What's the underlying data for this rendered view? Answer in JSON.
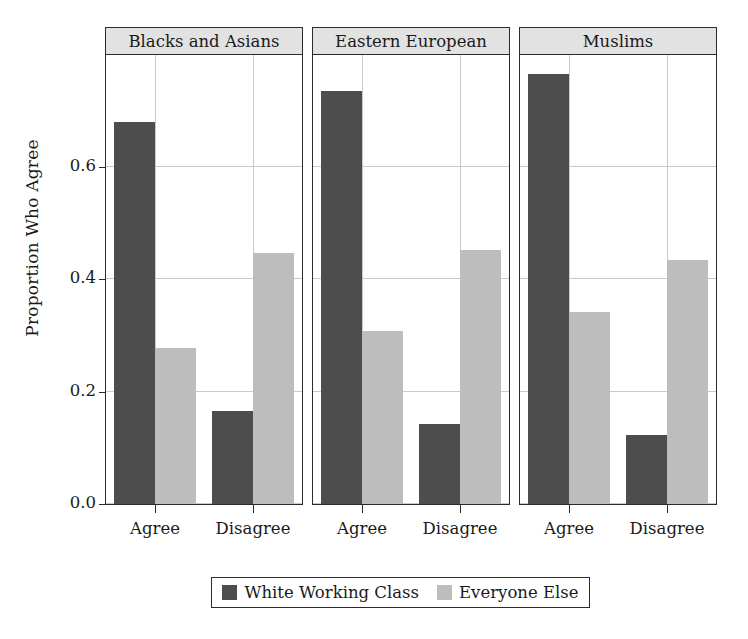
{
  "chart_data": {
    "type": "bar",
    "title": "",
    "subtitle": "",
    "xlabel": "",
    "ylabel": "Proportion Who Agree",
    "ylim": [
      0,
      0.8
    ],
    "yticks": [
      0.0,
      0.2,
      0.4,
      0.6
    ],
    "ytick_labels": [
      "0.0",
      "0.2",
      "0.4",
      "0.6"
    ],
    "grid": true,
    "legend_position": "bottom",
    "facet_layout": "1x3 columns",
    "categories": [
      "Agree",
      "Disagree"
    ],
    "facets": [
      "Blacks and Asians",
      "Eastern European",
      "Muslims"
    ],
    "series": [
      {
        "name": "White Working Class",
        "color": "#4d4d4d",
        "values_by_facet": {
          "Blacks and Asians": {
            "Agree": 0.68,
            "Disagree": 0.165
          },
          "Eastern European": {
            "Agree": 0.735,
            "Disagree": 0.142
          },
          "Muslims": {
            "Agree": 0.765,
            "Disagree": 0.122
          }
        }
      },
      {
        "name": "Everyone Else",
        "color": "#bdbdbd",
        "values_by_facet": {
          "Blacks and Asians": {
            "Agree": 0.278,
            "Disagree": 0.447
          },
          "Eastern European": {
            "Agree": 0.307,
            "Disagree": 0.452
          },
          "Muslims": {
            "Agree": 0.341,
            "Disagree": 0.434
          }
        }
      }
    ],
    "panels": [
      {
        "label": "Blacks and Asians",
        "groups": [
          {
            "label": "Agree",
            "bars": [
              {
                "series": "White Working Class",
                "value": 0.68
              },
              {
                "series": "Everyone Else",
                "value": 0.278
              }
            ]
          },
          {
            "label": "Disagree",
            "bars": [
              {
                "series": "White Working Class",
                "value": 0.165
              },
              {
                "series": "Everyone Else",
                "value": 0.447
              }
            ]
          }
        ]
      },
      {
        "label": "Eastern European",
        "groups": [
          {
            "label": "Agree",
            "bars": [
              {
                "series": "White Working Class",
                "value": 0.735
              },
              {
                "series": "Everyone Else",
                "value": 0.307
              }
            ]
          },
          {
            "label": "Disagree",
            "bars": [
              {
                "series": "White Working Class",
                "value": 0.142
              },
              {
                "series": "Everyone Else",
                "value": 0.452
              }
            ]
          }
        ]
      },
      {
        "label": "Muslims",
        "groups": [
          {
            "label": "Agree",
            "bars": [
              {
                "series": "White Working Class",
                "value": 0.765
              },
              {
                "series": "Everyone Else",
                "value": 0.341
              }
            ]
          },
          {
            "label": "Disagree",
            "bars": [
              {
                "series": "White Working Class",
                "value": 0.122
              },
              {
                "series": "Everyone Else",
                "value": 0.434
              }
            ]
          }
        ]
      }
    ]
  },
  "legend": {
    "items": [
      {
        "label": "White Working Class",
        "color": "#4d4d4d"
      },
      {
        "label": "Everyone Else",
        "color": "#bdbdbd"
      }
    ]
  },
  "colors": {
    "dark_series": "#4d4d4d",
    "light_series": "#bdbdbd",
    "strip_background": "#e2e2e2",
    "gridline": "#c9c9c9",
    "axis": "#2b2b2b",
    "background": "#ffffff"
  }
}
